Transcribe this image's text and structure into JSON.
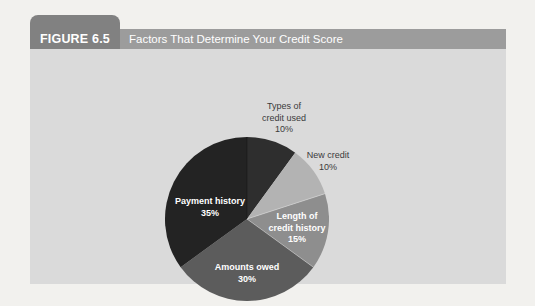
{
  "figure": {
    "label": "FIGURE 6.5",
    "title": "Factors That Determine Your Credit Score",
    "tab_color": "#818181",
    "label_section_color": "#818181",
    "title_bar_color": "#9c9c9c",
    "panel_color": "#dadada",
    "header_text_color": "#ffffff"
  },
  "chart_data": {
    "type": "pie",
    "title": "Factors That Determine Your Credit Score",
    "start_angle_deg": 0,
    "direction": "clockwise",
    "categories": [
      "Types of credit used",
      "New credit",
      "Length of credit history",
      "Amounts owed",
      "Payment history"
    ],
    "values": [
      10,
      10,
      15,
      30,
      35
    ],
    "unit": "%",
    "radius_px": 82,
    "legend": "none",
    "slices": [
      {
        "label": "Types of credit used",
        "pct": 10,
        "color": "#2e2e2e",
        "label_placement": "outside",
        "label_lines": [
          "Types of",
          "credit used",
          "10%"
        ],
        "lx": 254,
        "ly": 52
      },
      {
        "label": "New credit",
        "pct": 10,
        "color": "#b3b3b3",
        "label_placement": "outside",
        "label_lines": [
          "New credit",
          "10%"
        ],
        "lx": 298,
        "ly": 101
      },
      {
        "label": "Length of credit history",
        "pct": 15,
        "color": "#8e8e8e",
        "label_placement": "inside",
        "label_lines": [
          "Length of",
          "credit history",
          "15%"
        ],
        "lx": 267,
        "ly": 162
      },
      {
        "label": "Amounts owed",
        "pct": 30,
        "color": "#5c5c5c",
        "label_placement": "inside",
        "label_lines": [
          "Amounts owed",
          "30%"
        ],
        "lx": 217,
        "ly": 213
      },
      {
        "label": "Payment history",
        "pct": 35,
        "color": "#232323",
        "label_placement": "inside",
        "label_lines": [
          "Payment history",
          "35%"
        ],
        "lx": 180,
        "ly": 147
      }
    ],
    "hairlines": {
      "light_deg": [
        72,
        126
      ],
      "dark_deg": [
        0
      ]
    }
  }
}
